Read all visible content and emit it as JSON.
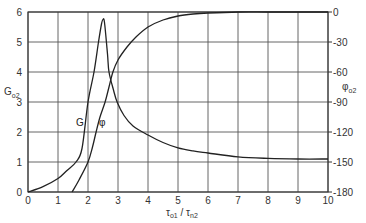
{
  "chart_data": {
    "type": "line",
    "title": "",
    "xlabel": "τo1 / τn2",
    "xlabel_main_1": "τ",
    "xlabel_sub_1": "o1",
    "xlabel_sep": " / ",
    "xlabel_main_2": "τ",
    "xlabel_sub_2": "n2",
    "ylabel_left": "Go2",
    "ylabel_left_main": "G",
    "ylabel_left_sub": "o2",
    "ylabel_right": "φo2",
    "ylabel_right_main": "φ",
    "ylabel_right_sub": "o2",
    "xlim": [
      0,
      10
    ],
    "ylim_left": [
      0,
      6
    ],
    "ylim_right": [
      -180,
      0
    ],
    "grid": true,
    "x_ticks": [
      "0",
      "1",
      "2",
      "3",
      "4",
      "5",
      "6",
      "7",
      "8",
      "9",
      "10"
    ],
    "y_left_ticks": [
      "0",
      "1",
      "2",
      "3",
      "4",
      "5",
      "6"
    ],
    "y_right_ticks": [
      "0",
      "-30",
      "-60",
      "-90",
      "-120",
      "-150",
      "-180"
    ],
    "series": [
      {
        "name": "G",
        "axis": "left",
        "label": "G",
        "x": [
          0,
          0.5,
          1.0,
          1.3,
          1.6,
          1.8,
          2.0,
          2.2,
          2.35,
          2.45,
          2.5,
          2.55,
          2.65,
          2.7,
          2.85,
          2.97,
          3.2,
          3.5,
          4.0,
          4.5,
          5.0,
          5.5,
          6.0,
          7.0,
          8.0,
          9.0,
          10.0
        ],
        "values": [
          0,
          0.18,
          0.45,
          0.72,
          1.0,
          1.45,
          3.0,
          4.0,
          5.0,
          5.6,
          5.75,
          5.65,
          4.6,
          4.0,
          3.4,
          3.0,
          2.55,
          2.2,
          1.9,
          1.65,
          1.47,
          1.37,
          1.3,
          1.17,
          1.12,
          1.1,
          1.1
        ]
      },
      {
        "name": "φ",
        "axis": "right",
        "label": "φ",
        "x": [
          1.47,
          1.7,
          2.0,
          2.15,
          2.27,
          2.4,
          2.57,
          2.7,
          2.83,
          3.0,
          3.3,
          3.6,
          4.0,
          4.5,
          5.0,
          5.5,
          6.0,
          7.0,
          8.0,
          9.0,
          10.0
        ],
        "values": [
          -180,
          -168,
          -150,
          -135,
          -120,
          -105,
          -90,
          -75,
          -60,
          -48,
          -35,
          -25,
          -15,
          -8,
          -4,
          -2,
          -1,
          0,
          0,
          0,
          0
        ]
      }
    ],
    "annotations": [
      {
        "text": "G",
        "x": 1.75,
        "y_left": 2.25
      },
      {
        "text": "φ",
        "x": 2.3,
        "y_left": 2.25
      }
    ]
  }
}
